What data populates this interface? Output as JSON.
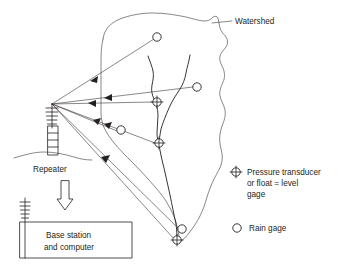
{
  "figure": {
    "type": "schematic-diagram",
    "title_visible": false,
    "background_color": "#ffffff",
    "ink_color": "#231f20",
    "labels": {
      "watershed": "Watershed",
      "repeater": "Repeater",
      "base_station_line1": "Base station",
      "base_station_line2": "and computer"
    },
    "legend": {
      "items": [
        {
          "symbol": "pressure-transducer-symbol",
          "symbol_desc": "circle-with-cross",
          "line1": "Pressure transducer",
          "line2": "or float = level",
          "line3": "gage"
        },
        {
          "symbol": "rain-gage-symbol",
          "symbol_desc": "open-circle",
          "line1": "Rain gage"
        }
      ]
    },
    "stations": {
      "rain_gages": [
        {
          "name": "rain-gage-upper",
          "x": 157,
          "y": 37
        },
        {
          "name": "rain-gage-right",
          "x": 197,
          "y": 87
        },
        {
          "name": "rain-gage-mid-left",
          "x": 121,
          "y": 130
        },
        {
          "name": "rain-gage-outlet",
          "x": 182,
          "y": 229
        }
      ],
      "level_gages": [
        {
          "name": "level-gage-upper",
          "x": 157,
          "y": 102
        },
        {
          "name": "level-gage-mid",
          "x": 159,
          "y": 143
        },
        {
          "name": "level-gage-outlet",
          "x": 177,
          "y": 240
        }
      ]
    },
    "repeater": {
      "hub_x": 52,
      "hub_y": 104,
      "antenna_label": "yagi-antenna",
      "tower_label": "lattice-tower"
    },
    "base_station": {
      "box_x": 20,
      "box_y": 222,
      "box_w": 112,
      "box_h": 36,
      "antenna_label": "whip-antenna"
    },
    "telemetry_links": {
      "count": 7,
      "direction": "toward-repeater",
      "arrowhead": "solid-triangle"
    },
    "downlink": {
      "name": "repeater-to-base-arrow",
      "style": "hollow-outline-arrow",
      "direction": "down"
    }
  }
}
